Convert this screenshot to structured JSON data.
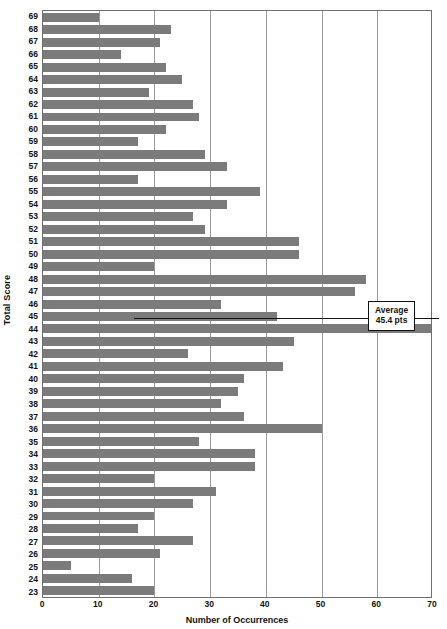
{
  "chart_data": {
    "type": "bar",
    "orientation": "horizontal",
    "title": "",
    "xlabel": "Number of Occurrences",
    "ylabel": "Total Score",
    "xlim": [
      0,
      70
    ],
    "xticks": [
      0,
      10,
      20,
      30,
      40,
      50,
      60,
      70
    ],
    "grid": "vertical",
    "legend": "none",
    "bar_color": "#7b7b7b",
    "categories": [
      69,
      68,
      67,
      66,
      65,
      64,
      63,
      62,
      61,
      60,
      59,
      58,
      57,
      56,
      55,
      54,
      53,
      52,
      51,
      50,
      49,
      48,
      47,
      46,
      45,
      44,
      43,
      42,
      41,
      40,
      39,
      38,
      37,
      36,
      35,
      34,
      33,
      32,
      31,
      30,
      29,
      28,
      27,
      26,
      25,
      24,
      23
    ],
    "values": [
      10,
      23,
      21,
      14,
      22,
      25,
      19,
      27,
      28,
      22,
      17,
      29,
      33,
      17,
      39,
      33,
      27,
      29,
      46,
      46,
      20,
      58,
      56,
      32,
      42,
      70,
      45,
      26,
      43,
      36,
      35,
      32,
      36,
      50,
      28,
      38,
      38,
      20,
      31,
      27,
      20,
      17,
      27,
      21,
      5,
      16,
      20
    ],
    "annotations": [
      {
        "name": "average-callout",
        "line1": "Average",
        "line2": "45.4 pts",
        "points_to_category": 45
      }
    ]
  },
  "axis": {
    "y_title": "Total Score",
    "x_title": "Number of Occurrences",
    "x_tick_labels": [
      "0",
      "10",
      "20",
      "30",
      "40",
      "50",
      "60",
      "70"
    ],
    "y_tick_labels": [
      "69",
      "68",
      "67",
      "66",
      "65",
      "64",
      "63",
      "62",
      "61",
      "60",
      "59",
      "58",
      "57",
      "56",
      "55",
      "54",
      "53",
      "52",
      "51",
      "50",
      "49",
      "48",
      "47",
      "46",
      "45",
      "44",
      "43",
      "42",
      "41",
      "40",
      "39",
      "38",
      "37",
      "36",
      "35",
      "34",
      "33",
      "32",
      "31",
      "30",
      "29",
      "28",
      "27",
      "26",
      "25",
      "24",
      "23"
    ]
  },
  "annotation": {
    "average_label": "Average",
    "average_value": "45.4 pts"
  },
  "colors": {
    "bar": "#7b7b7b",
    "grid": "#9a9a9a",
    "frame": "#6f6f6f",
    "text": "#111111",
    "background": "#ffffff"
  }
}
